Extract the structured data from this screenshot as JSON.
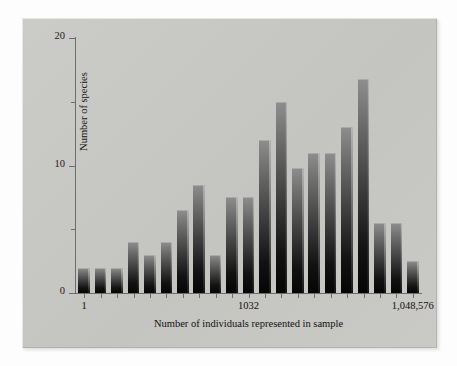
{
  "chart_data": {
    "type": "bar",
    "title": "",
    "xlabel": "Number of individuals represented in sample",
    "ylabel": "Number of species",
    "ylim": [
      0,
      20
    ],
    "y_ticks": [
      0,
      10,
      20
    ],
    "y_minor_ticks": [
      5,
      15
    ],
    "y_tick_labels": [
      "0",
      "10",
      "20"
    ],
    "x_tick_labels": [
      "1",
      "1032",
      "1,048,576"
    ],
    "x_tick_positions": [
      0,
      10,
      20
    ],
    "grid": false,
    "legend": null,
    "n_bars": 21,
    "bar_color": "#2a2a2a",
    "categories": [
      "1",
      "2",
      "4",
      "8",
      "16",
      "32",
      "64",
      "128",
      "256",
      "512",
      "1032",
      "2048",
      "4096",
      "8192",
      "16384",
      "32768",
      "65536",
      "131072",
      "262144",
      "524288",
      "1,048,576"
    ],
    "values": [
      2,
      2,
      2,
      4,
      3,
      4,
      6.5,
      8.5,
      3,
      7.5,
      7.5,
      12,
      15,
      9.8,
      11,
      11,
      13,
      16.8,
      5.5,
      5.5,
      2.5
    ]
  },
  "figure": {
    "panel_color": "#c8c8c4",
    "background_color": "#ffffff",
    "axis_color": "#6d6d6b"
  }
}
